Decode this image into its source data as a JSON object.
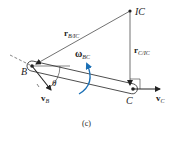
{
  "figure": {
    "caption": "(c)",
    "points": {
      "ic": {
        "label": "IC",
        "x": 130,
        "y": 11
      },
      "b": {
        "label": "B",
        "x": 32,
        "y": 66
      },
      "c": {
        "label": "C",
        "x": 133,
        "y": 89
      }
    },
    "vectors": {
      "r_b_ic": {
        "main": "r",
        "sub": "B/IC"
      },
      "r_c_ic": {
        "main": "r",
        "sub": "C/IC"
      },
      "v_b": {
        "main": "v",
        "sub": "B"
      },
      "v_c": {
        "main": "v",
        "sub": "C"
      }
    },
    "angular_velocity": {
      "main": "ω",
      "sub": "BC"
    },
    "angle": {
      "label": "θ"
    },
    "colors": {
      "line": "#333333",
      "omega_arrow": "#1a6fb5"
    }
  }
}
